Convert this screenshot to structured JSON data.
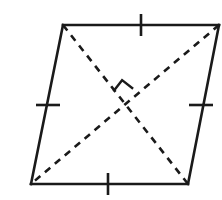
{
  "figure": {
    "name": "rhombus-with-perpendicular-diagonals",
    "type": "geometry-diagram",
    "shape": "rhombus",
    "background_color": "#ffffff",
    "stroke_color": "#1a1a1a",
    "canvas": {
      "width": 222,
      "height": 200
    },
    "vertices": [
      {
        "id": "top-left",
        "x": 63,
        "y": 25
      },
      {
        "id": "top-right",
        "x": 219,
        "y": 25
      },
      {
        "id": "bottom-right",
        "x": 188,
        "y": 184
      },
      {
        "id": "bottom-left",
        "x": 31,
        "y": 184
      }
    ],
    "sides": [
      {
        "id": "top-side",
        "from": "top-left",
        "to": "top-right",
        "style": "solid",
        "stroke_width": 2.6
      },
      {
        "id": "right-side",
        "from": "top-right",
        "to": "bottom-right",
        "style": "solid",
        "stroke_width": 2.6
      },
      {
        "id": "bottom-side",
        "from": "bottom-right",
        "to": "bottom-left",
        "style": "solid",
        "stroke_width": 2.6
      },
      {
        "id": "left-side",
        "from": "bottom-left",
        "to": "top-left",
        "style": "solid",
        "stroke_width": 2.6
      }
    ],
    "diagonals": [
      {
        "id": "diagonal-tl-br",
        "from": "top-left",
        "to": "bottom-right",
        "style": "dashed",
        "stroke_width": 2.6,
        "dash_pattern": "7 6"
      },
      {
        "id": "diagonal-tr-bl",
        "from": "top-right",
        "to": "bottom-left",
        "style": "dashed",
        "stroke_width": 2.6,
        "dash_pattern": "7 6"
      }
    ],
    "intersection": {
      "id": "diagonal-intersection",
      "x": 125,
      "y": 104
    },
    "congruence_ticks": [
      {
        "id": "tick-top-side",
        "side": "top-side",
        "x": 141,
        "y": 25,
        "orientation": "vertical",
        "length": 22,
        "stroke_width": 2.6
      },
      {
        "id": "tick-right-side",
        "side": "right-side",
        "x": 201,
        "y": 105,
        "orientation": "horizontal",
        "length": 24,
        "stroke_width": 2.6
      },
      {
        "id": "tick-bottom-side",
        "side": "bottom-side",
        "x": 108,
        "y": 184,
        "orientation": "vertical",
        "length": 22,
        "stroke_width": 2.6
      },
      {
        "id": "tick-left-side",
        "side": "left-side",
        "x": 48,
        "y": 105,
        "orientation": "horizontal",
        "length": 24,
        "stroke_width": 2.6
      }
    ],
    "right_angle_mark": {
      "id": "right-angle-square",
      "meaning": "diagonals are perpendicular",
      "center_x": 125,
      "center_y": 104,
      "size": 17,
      "rotation_deg": 38,
      "stroke_width": 2.4,
      "path": "M -17 -3 L -17 -17 L -3 -17"
    },
    "labels": []
  }
}
